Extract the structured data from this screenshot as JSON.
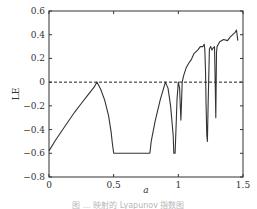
{
  "chart_data": {
    "type": "line",
    "title": "",
    "xlabel": "a",
    "ylabel": "LE",
    "xlim": [
      0,
      1.5
    ],
    "ylim": [
      -0.8,
      0.6
    ],
    "xticks": [
      "0",
      "0.5",
      "1",
      "1.5"
    ],
    "yticks": [
      "0.6",
      "0.4",
      "0.2",
      "0",
      "−0.2",
      "−0.4",
      "−0.6",
      "−0.8"
    ],
    "grid": false,
    "legend": null,
    "reference_line": {
      "y": 0,
      "style": "dashed"
    },
    "series": [
      {
        "name": "Lyapunov exponent",
        "x": [
          0,
          0.05,
          0.1,
          0.15,
          0.2,
          0.25,
          0.3,
          0.35,
          0.37,
          0.4,
          0.43,
          0.46,
          0.48,
          0.49,
          0.5,
          0.55,
          0.6,
          0.65,
          0.7,
          0.75,
          0.78,
          0.79,
          0.82,
          0.86,
          0.9,
          0.92,
          0.94,
          0.96,
          0.965,
          0.975,
          0.985,
          0.99,
          1.0,
          1.01,
          1.015,
          1.02,
          1.025,
          1.03,
          1.04,
          1.06,
          1.08,
          1.1,
          1.12,
          1.15,
          1.17,
          1.19,
          1.2,
          1.205,
          1.21,
          1.215,
          1.22,
          1.225,
          1.23,
          1.24,
          1.25,
          1.26,
          1.27,
          1.28,
          1.285,
          1.29,
          1.295,
          1.3,
          1.32,
          1.35,
          1.38,
          1.4,
          1.42,
          1.44,
          1.45,
          1.46
        ],
        "y": [
          -0.58,
          -0.49,
          -0.41,
          -0.33,
          -0.25,
          -0.18,
          -0.11,
          -0.04,
          0.0,
          -0.06,
          -0.15,
          -0.28,
          -0.42,
          -0.52,
          -0.6,
          -0.6,
          -0.6,
          -0.6,
          -0.6,
          -0.6,
          -0.6,
          -0.5,
          -0.33,
          -0.15,
          0.0,
          -0.05,
          -0.2,
          -0.45,
          -0.6,
          -0.6,
          -0.3,
          -0.15,
          0.0,
          -0.05,
          -0.2,
          -0.32,
          -0.15,
          0.0,
          0.05,
          0.12,
          0.16,
          0.19,
          0.24,
          0.27,
          0.3,
          0.3,
          0.32,
          0.28,
          0.1,
          -0.2,
          -0.45,
          -0.5,
          -0.2,
          0.28,
          0.3,
          0.27,
          0.29,
          0.3,
          0.0,
          -0.3,
          0.25,
          0.3,
          0.34,
          0.36,
          0.35,
          0.38,
          0.4,
          0.42,
          0.44,
          0.35
        ]
      }
    ]
  },
  "caption": "图 ... 映射的 Lyapunov 指数图"
}
